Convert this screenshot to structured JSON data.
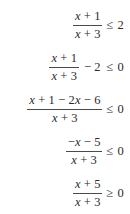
{
  "document": {
    "type": "math-derivation",
    "description": "Step-by-step solution of a rational inequality",
    "background_color": "#ffffff",
    "text_color": "#2b2b2b",
    "rule_color": "#4a4a4a",
    "alignment": "right"
  },
  "steps": [
    {
      "id": "step-1",
      "numerator": "x + 1",
      "denominator": "x + 3",
      "middle": "",
      "relation": "≤",
      "right_side": "2",
      "plain": "(x + 1)/(x + 3) ≤ 2"
    },
    {
      "id": "step-2",
      "numerator": "x + 1",
      "denominator": "x + 3",
      "middle": "− 2",
      "relation": "≤",
      "right_side": "0",
      "plain": "(x + 1)/(x + 3) − 2 ≤ 0"
    },
    {
      "id": "step-3",
      "numerator": "x + 1 − 2x − 6",
      "denominator": "x + 3",
      "middle": "",
      "relation": "≤",
      "right_side": "0",
      "plain": "(x + 1 − 2x − 6)/(x + 3) ≤ 0"
    },
    {
      "id": "step-4",
      "numerator": "−x − 5",
      "denominator": "x + 3",
      "middle": "",
      "relation": "≤",
      "right_side": "0",
      "plain": "(−x − 5)/(x + 3) ≤ 0"
    },
    {
      "id": "step-5",
      "numerator": "x + 5",
      "denominator": "x + 3",
      "middle": "",
      "relation": "≥",
      "right_side": "0",
      "plain": "(x + 5)/(x + 3) ≥ 0"
    }
  ]
}
